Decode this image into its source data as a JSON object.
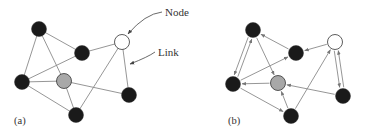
{
  "figure": {
    "panels": [
      {
        "id": "a",
        "label": "(a)",
        "label_pos": [
          14,
          124
        ],
        "directed": false,
        "nodes": [
          {
            "id": "A",
            "x": 39,
            "y": 29,
            "type": "black"
          },
          {
            "id": "B",
            "x": 82,
            "y": 53,
            "type": "black"
          },
          {
            "id": "C",
            "x": 122,
            "y": 42,
            "type": "white"
          },
          {
            "id": "D",
            "x": 22,
            "y": 82,
            "type": "black"
          },
          {
            "id": "E",
            "x": 64,
            "y": 81,
            "type": "gray"
          },
          {
            "id": "F",
            "x": 129,
            "y": 95,
            "type": "black"
          },
          {
            "id": "G",
            "x": 76,
            "y": 115,
            "type": "black"
          }
        ],
        "edges": [
          [
            "A",
            "D"
          ],
          [
            "A",
            "E"
          ],
          [
            "A",
            "B"
          ],
          [
            "B",
            "D"
          ],
          [
            "B",
            "C"
          ],
          [
            "C",
            "G"
          ],
          [
            "C",
            "F"
          ],
          [
            "D",
            "E"
          ],
          [
            "D",
            "G"
          ],
          [
            "E",
            "F"
          ],
          [
            "E",
            "G"
          ]
        ]
      },
      {
        "id": "b",
        "label": "(b)",
        "label_pos": [
          228,
          124
        ],
        "directed": true,
        "nodes": [
          {
            "id": "A",
            "x": 253,
            "y": 30,
            "type": "black"
          },
          {
            "id": "B",
            "x": 296,
            "y": 53,
            "type": "black"
          },
          {
            "id": "C",
            "x": 335,
            "y": 42,
            "type": "white"
          },
          {
            "id": "D",
            "x": 233,
            "y": 84,
            "type": "black"
          },
          {
            "id": "E",
            "x": 278,
            "y": 83,
            "type": "gray"
          },
          {
            "id": "F",
            "x": 343,
            "y": 96,
            "type": "black"
          },
          {
            "id": "G",
            "x": 291,
            "y": 116,
            "type": "black"
          }
        ],
        "edges": [
          [
            "A",
            "D"
          ],
          [
            "D",
            "A"
          ],
          [
            "A",
            "E"
          ],
          [
            "B",
            "A"
          ],
          [
            "D",
            "B"
          ],
          [
            "C",
            "B"
          ],
          [
            "G",
            "C"
          ],
          [
            "C",
            "F"
          ],
          [
            "F",
            "C"
          ],
          [
            "E",
            "D"
          ],
          [
            "D",
            "G"
          ],
          [
            "F",
            "E"
          ],
          [
            "G",
            "E"
          ]
        ]
      }
    ],
    "annotations": [
      {
        "text": "Node",
        "x": 165,
        "y": 16,
        "arrow_to": [
          128,
          34
        ],
        "curve_via": [
          145,
          14
        ]
      },
      {
        "text": "Link",
        "x": 158,
        "y": 56,
        "arrow_to": [
          130,
          64
        ],
        "curve_via": [
          148,
          57
        ]
      }
    ],
    "colors": {
      "black_node": "#1a1a1a",
      "gray_node": "#a8a8a8",
      "white_node": "#ffffff",
      "node_stroke": "#333333",
      "edge": "#8a8a8a"
    },
    "node_radius": 7.5
  }
}
